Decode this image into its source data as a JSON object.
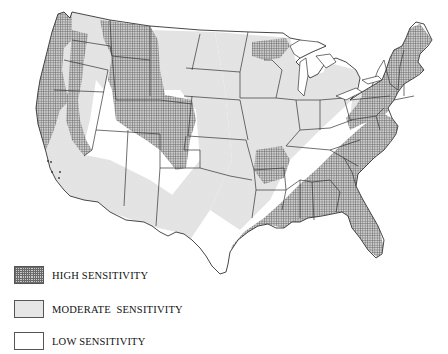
{
  "map": {
    "subject": "Contiguous United States sensitivity map",
    "colors": {
      "high_fill": "#9a9a9a",
      "moderate_fill": "#e3e3e3",
      "low_fill": "#ffffff",
      "border": "#333333"
    }
  },
  "legend": {
    "items": [
      {
        "key": "high",
        "label": "HIGH SENSITIVITY",
        "pattern": "crosshatch"
      },
      {
        "key": "moderate",
        "label": "MODERATE  SENSITIVITY",
        "pattern": "stipple"
      },
      {
        "key": "low",
        "label": "LOW SENSITIVITY",
        "pattern": "blank"
      }
    ]
  }
}
